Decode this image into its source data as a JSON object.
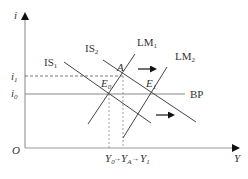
{
  "diagram": {
    "axes": {
      "y_label": "i",
      "x_label": "Y",
      "origin_label": "O"
    },
    "interest_rates": [
      {
        "base": "i",
        "sub": "1"
      },
      {
        "base": "i",
        "sub": "0"
      }
    ],
    "curves": {
      "is1": {
        "base": "IS",
        "sub": "1"
      },
      "is2": {
        "base": "IS",
        "sub": "2"
      },
      "lm1": {
        "base": "LM",
        "sub": "1"
      },
      "lm2": {
        "base": "LM",
        "sub": "2"
      },
      "bp": "BP"
    },
    "points": {
      "a": "A",
      "e0": {
        "base": "E",
        "sub": "0"
      },
      "e1": {
        "base": "E",
        "sub": "1"
      }
    },
    "outputs": {
      "y0": {
        "base": "Y",
        "sub": "0"
      },
      "ya": {
        "base": "Y",
        "sub": "A"
      },
      "y1": {
        "base": "Y",
        "sub": "1"
      },
      "arrow": "→"
    },
    "colors": {
      "axis": "#888888",
      "curve": "#444444",
      "text": "#333333",
      "arrow": "#111111"
    }
  }
}
